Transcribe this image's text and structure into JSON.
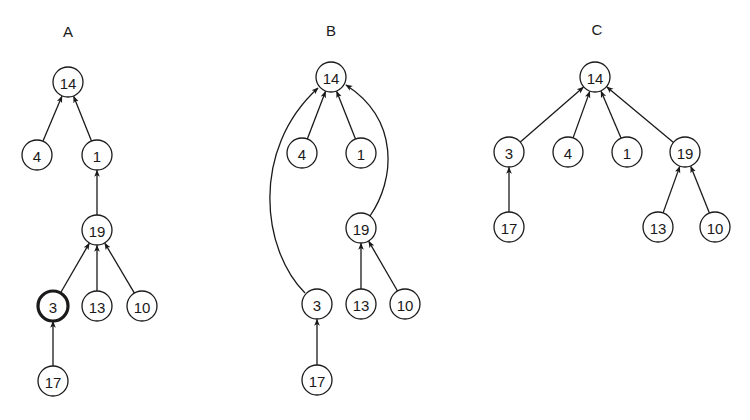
{
  "diagram": {
    "node_radius": 15,
    "colors": {
      "stroke": "#1a1a1a",
      "fill": "#ffffff",
      "background": "#ffffff"
    },
    "panels": [
      {
        "id": "A",
        "label": "A",
        "label_pos": [
          68,
          37
        ],
        "nodes": [
          {
            "id": "14",
            "label": "14",
            "x": 68,
            "y": 82
          },
          {
            "id": "4",
            "label": "4",
            "x": 37,
            "y": 155
          },
          {
            "id": "1",
            "label": "1",
            "x": 97,
            "y": 155
          },
          {
            "id": "19",
            "label": "19",
            "x": 97,
            "y": 230
          },
          {
            "id": "3",
            "label": "3",
            "x": 53,
            "y": 306,
            "highlight": true
          },
          {
            "id": "13",
            "label": "13",
            "x": 97,
            "y": 306
          },
          {
            "id": "10",
            "label": "10",
            "x": 142,
            "y": 306
          },
          {
            "id": "17",
            "label": "17",
            "x": 53,
            "y": 381
          }
        ],
        "edges": [
          {
            "from": "4",
            "to": "14"
          },
          {
            "from": "1",
            "to": "14"
          },
          {
            "from": "19",
            "to": "1"
          },
          {
            "from": "3",
            "to": "19"
          },
          {
            "from": "13",
            "to": "19"
          },
          {
            "from": "10",
            "to": "19"
          },
          {
            "from": "17",
            "to": "3"
          }
        ]
      },
      {
        "id": "B",
        "label": "B",
        "label_pos": [
          331,
          36
        ],
        "nodes": [
          {
            "id": "14",
            "label": "14",
            "x": 331,
            "y": 77
          },
          {
            "id": "4",
            "label": "4",
            "x": 302,
            "y": 153
          },
          {
            "id": "1",
            "label": "1",
            "x": 361,
            "y": 153
          },
          {
            "id": "19",
            "label": "19",
            "x": 361,
            "y": 228
          },
          {
            "id": "3",
            "label": "3",
            "x": 317,
            "y": 304
          },
          {
            "id": "13",
            "label": "13",
            "x": 361,
            "y": 304
          },
          {
            "id": "10",
            "label": "10",
            "x": 405,
            "y": 304
          },
          {
            "id": "17",
            "label": "17",
            "x": 317,
            "y": 380
          }
        ],
        "edges": [
          {
            "from": "4",
            "to": "14"
          },
          {
            "from": "1",
            "to": "14"
          },
          {
            "from": "3",
            "to": "14",
            "curve": "M 305 293 C 262 250, 250 150, 318 88"
          },
          {
            "from": "19",
            "to": "14",
            "curve": "M 370 216 C 395 180, 400 120, 346 85"
          },
          {
            "from": "13",
            "to": "19"
          },
          {
            "from": "10",
            "to": "19"
          },
          {
            "from": "17",
            "to": "3"
          }
        ]
      },
      {
        "id": "C",
        "label": "C",
        "label_pos": [
          597,
          35
        ],
        "nodes": [
          {
            "id": "14",
            "label": "14",
            "x": 595,
            "y": 77
          },
          {
            "id": "3",
            "label": "3",
            "x": 509,
            "y": 152
          },
          {
            "id": "4",
            "label": "4",
            "x": 568,
            "y": 152
          },
          {
            "id": "1",
            "label": "1",
            "x": 627,
            "y": 152
          },
          {
            "id": "19",
            "label": "19",
            "x": 685,
            "y": 152
          },
          {
            "id": "17",
            "label": "17",
            "x": 509,
            "y": 227
          },
          {
            "id": "13",
            "label": "13",
            "x": 658,
            "y": 227
          },
          {
            "id": "10",
            "label": "10",
            "x": 715,
            "y": 227
          }
        ],
        "edges": [
          {
            "from": "3",
            "to": "14"
          },
          {
            "from": "4",
            "to": "14"
          },
          {
            "from": "1",
            "to": "14"
          },
          {
            "from": "19",
            "to": "14"
          },
          {
            "from": "17",
            "to": "3"
          },
          {
            "from": "13",
            "to": "19"
          },
          {
            "from": "10",
            "to": "19"
          }
        ]
      }
    ]
  }
}
